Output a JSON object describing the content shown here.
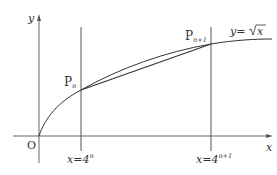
{
  "diagram": {
    "type": "function-graph",
    "function_label": "y=√x",
    "function_lhs": "y=",
    "function_rhs_var": "x",
    "axes": {
      "x_label": "x",
      "y_label": "y",
      "origin_label": "O"
    },
    "points": [
      {
        "label_base": "P",
        "label_sub": "n",
        "x_expr": "4^n"
      },
      {
        "label_base": "P",
        "label_sub": "n+1",
        "x_expr": "4^(n+1)"
      }
    ],
    "vertical_lines": [
      {
        "label_lhs": "x=4",
        "label_sup": "n"
      },
      {
        "label_lhs": "x=4",
        "label_sup": "n+1"
      }
    ],
    "colors": {
      "stroke": "#333333",
      "axis": "#555555",
      "background": "#ffffff"
    }
  }
}
